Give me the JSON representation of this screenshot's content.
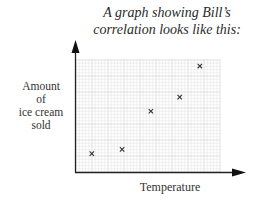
{
  "chart_data": {
    "type": "scatter",
    "title": "A graph showing Bill’s correlation looks like this:",
    "title_lines": [
      "A graph showing Bill’s",
      "correlation looks like this:"
    ],
    "xlabel": "Temperature",
    "ylabel": "Amount of ice cream sold",
    "ylabel_lines": [
      "Amount",
      "of",
      "ice cream",
      "sold"
    ],
    "grid": true,
    "tick_labels": false,
    "marker": "x",
    "xlim": [
      0,
      10
    ],
    "ylim": [
      0,
      8
    ],
    "points": [
      {
        "x": 1.1,
        "y": 1.3
      },
      {
        "x": 3.2,
        "y": 1.6
      },
      {
        "x": 5.2,
        "y": 4.3
      },
      {
        "x": 7.2,
        "y": 5.3
      },
      {
        "x": 8.6,
        "y": 7.5
      }
    ],
    "correlation": "positive"
  },
  "colors": {
    "axis": "#222222",
    "grid_minor": "#e6e6e6",
    "grid_major": "#cfcfcf",
    "marker": "#333333"
  }
}
